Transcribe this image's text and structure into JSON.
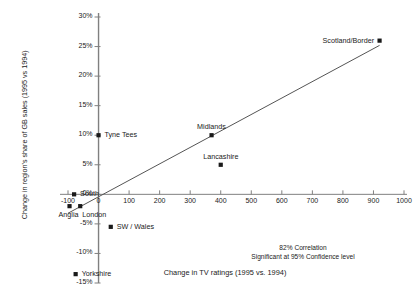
{
  "chart_data": {
    "type": "scatter",
    "title": "",
    "xlabel": "Change in TV ratings (1995 vs. 1994)",
    "ylabel": "Change in region's share of GB sales (1995 vs 1994)",
    "xlim": [
      -100,
      1000
    ],
    "ylim": [
      -15,
      30
    ],
    "xticks": [
      -100,
      0,
      100,
      200,
      300,
      400,
      500,
      600,
      700,
      800,
      900,
      1000
    ],
    "xtick_labels": [
      "-100",
      "0",
      "100",
      "200",
      "300",
      "400",
      "500",
      "600",
      "700",
      "800",
      "900",
      "1000"
    ],
    "yticks": [
      -15,
      -10,
      -5,
      0,
      5,
      10,
      15,
      20,
      25,
      30
    ],
    "ytick_labels": [
      "-15%",
      "-10%",
      "-5%",
      "0%",
      "5%",
      "10%",
      "15%",
      "20%",
      "25%",
      "30%"
    ],
    "grid": false,
    "legend": "none",
    "marker": "square",
    "marker_color": "#1a1a1a",
    "points": [
      {
        "name": "Tyne Tees",
        "x": 0,
        "y": 10.0,
        "label_pos": "right"
      },
      {
        "name": "Midlands",
        "x": 370,
        "y": 10.0,
        "label_pos": "above"
      },
      {
        "name": "Lancashire",
        "x": 400,
        "y": 5.0,
        "label_pos": "above"
      },
      {
        "name": "Scotland/Border",
        "x": 920,
        "y": 26.0,
        "label_pos": "left"
      },
      {
        "name": "South",
        "x": -80,
        "y": 0.0,
        "label_pos": "right"
      },
      {
        "name": "Anglia",
        "x": -95,
        "y": -2.0,
        "label_pos": "below"
      },
      {
        "name": "London",
        "x": -60,
        "y": -2.0,
        "label_pos": "below-right"
      },
      {
        "name": "SW / Wales",
        "x": 40,
        "y": -5.5,
        "label_pos": "right"
      },
      {
        "name": "Yorkshire",
        "x": -75,
        "y": -13.5,
        "label_pos": "right"
      }
    ],
    "trendline": {
      "x_start": -100,
      "y_start": -3.2,
      "x_end": 920,
      "y_end": 25.2,
      "color": "#555555"
    },
    "annotations": [
      "82% Correlation",
      "Significant at 95% Confidence level"
    ],
    "axis_color": "#808080"
  }
}
